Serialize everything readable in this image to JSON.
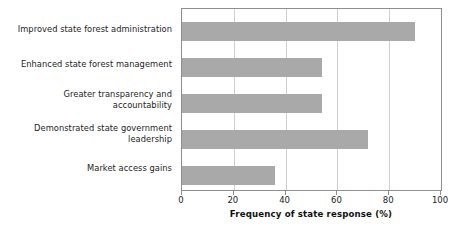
{
  "chart_data": {
    "type": "bar",
    "orientation": "horizontal",
    "title": "",
    "subtitle": "",
    "xlabel": "Frequency of state response (%)",
    "ylabel": "",
    "categories": [
      "Improved state forest administration",
      "Enhanced state forest management",
      "Greater transparency and\naccountability",
      "Demonstrated state government\nleadership",
      "Market access gains"
    ],
    "values": [
      90,
      54,
      54,
      72,
      36
    ],
    "xlim": [
      0,
      100
    ],
    "xticks": [
      0,
      20,
      40,
      60,
      80,
      100
    ],
    "xtick_labels": [
      "0",
      "20",
      "40",
      "60",
      "80",
      "100"
    ],
    "grid": "vertical",
    "legend": "none",
    "bar_color": "#a9a9a9",
    "axis_color": "#8e8e8e",
    "gridline_color": "#cfcfcf",
    "background": "#ffffff"
  }
}
